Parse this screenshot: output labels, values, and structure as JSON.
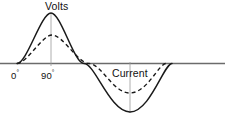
{
  "figure": {
    "title": "",
    "background_color": "#ffffff",
    "width": 225,
    "height": 118
  },
  "labels": {
    "volts": "Volts",
    "current": "Current",
    "zero_value": "0",
    "zero_unit": "°",
    "ninety_value": "90",
    "ninety_unit": "°"
  },
  "colors": {
    "curve_solid": "#1a1a1a",
    "curve_dashed": "#1a1a1a",
    "axis": "#6b6b6b",
    "tick_line": "#9a9a9a",
    "text": "#111111"
  },
  "chart_data": {
    "type": "line",
    "title": "",
    "xlabel": "",
    "ylabel": "",
    "grid": false,
    "legend_position": "inline-annotation",
    "axis": {
      "baseline_y_px": 63.5,
      "x_start_px": 0,
      "x_end_px": 225,
      "zero_crossings_deg": [
        0,
        180,
        360
      ],
      "zero_crossing_x_px": [
        17,
        84,
        172
      ],
      "degrees_per_px": 2.32
    },
    "x_deg": [
      0,
      15,
      30,
      45,
      60,
      75,
      90,
      105,
      120,
      135,
      150,
      165,
      180,
      195,
      210,
      225,
      240,
      255,
      270,
      285,
      300,
      315,
      330,
      345,
      360
    ],
    "series": [
      {
        "name": "Volts",
        "style": "solid",
        "stroke_width": 1.5,
        "phase_deg": 0,
        "amplitude_px": 50,
        "peak_x_px": 51,
        "peak_y_px": 13,
        "trough_x_px": 130,
        "trough_y_px": 112,
        "values": [
          0,
          0.259,
          0.5,
          0.707,
          0.866,
          0.966,
          1.0,
          0.966,
          0.866,
          0.707,
          0.5,
          0.259,
          0,
          -0.259,
          -0.5,
          -0.707,
          -0.866,
          -0.966,
          -1.0,
          -0.966,
          -0.866,
          -0.707,
          -0.5,
          -0.259,
          0
        ]
      },
      {
        "name": "Current",
        "style": "dashed",
        "stroke_width": 1.4,
        "dash_pattern": "4,3",
        "phase_deg": -12,
        "amplitude_px": 28,
        "peak_x_px": 51,
        "peak_y_px": 35,
        "trough_x_px": 130,
        "trough_y_px": 93,
        "values": [
          -0.208,
          0.052,
          0.309,
          0.53,
          0.719,
          0.866,
          0.956,
          0.999,
          0.978,
          0.899,
          0.766,
          0.582,
          0.358,
          0.105,
          -0.156,
          -0.407,
          -0.629,
          -0.809,
          -0.934,
          -0.995,
          -0.99,
          -0.921,
          -0.788,
          -0.602,
          -0.375
        ]
      }
    ],
    "annotations": [
      {
        "text": "Volts",
        "x_px": 45,
        "y_px": 1,
        "points_to": "solid-peak"
      },
      {
        "text": "Current",
        "x_px": 112,
        "y_px": 68,
        "points_to": "dashed-trough"
      },
      {
        "text": "0°",
        "x_px": 11,
        "y_px": 70,
        "axis_position_deg": 0
      },
      {
        "text": "90°",
        "x_px": 41,
        "y_px": 70,
        "axis_position_deg": 90
      }
    ],
    "tick_marks": [
      {
        "x_px": 51,
        "from_y_px": 13,
        "to_y_px": 66,
        "label": "90°"
      },
      {
        "x_px": 130,
        "from_y_px": 62,
        "to_y_px": 113,
        "label": ""
      }
    ]
  }
}
